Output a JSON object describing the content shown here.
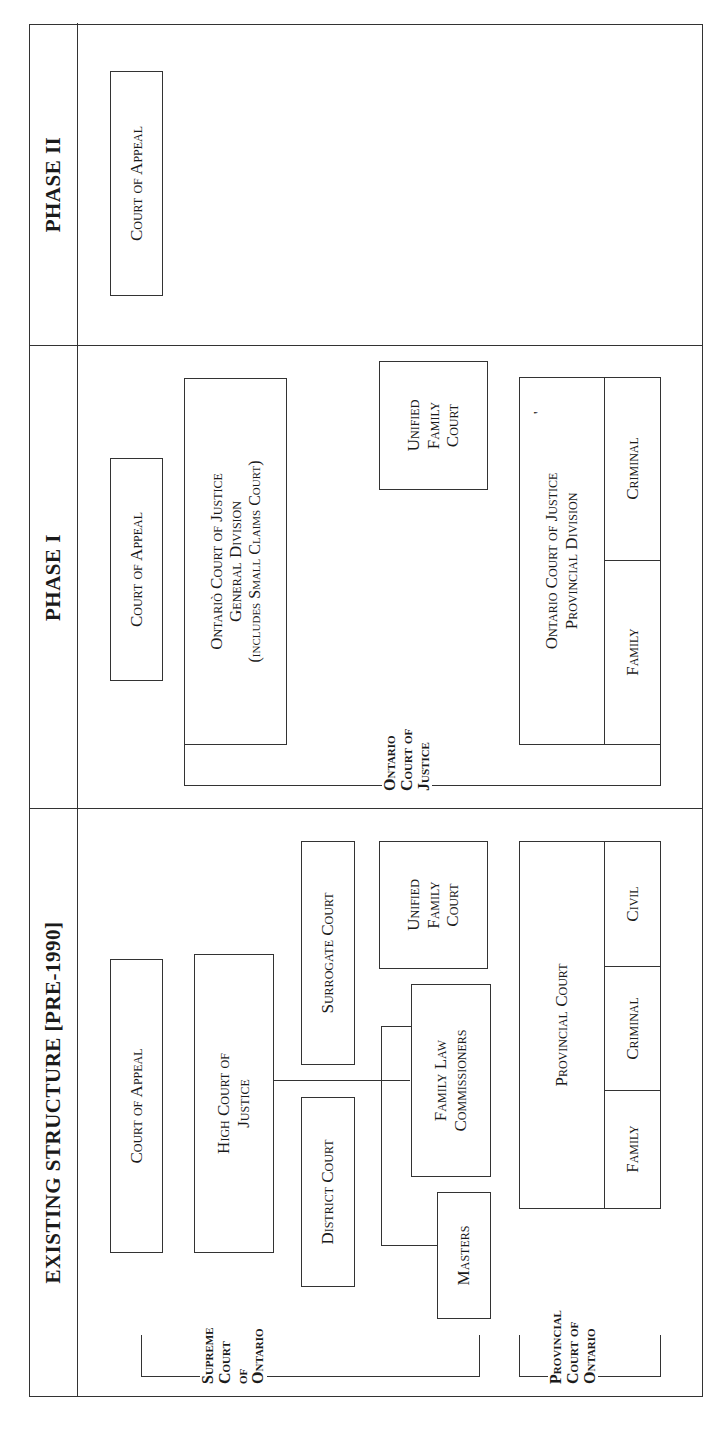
{
  "orientation": "rotated-90-ccw",
  "columns": [
    {
      "id": "existing",
      "header": "EXISTING STRUCTURE [PRE-1990]"
    },
    {
      "id": "phase1",
      "header": "PHASE I"
    },
    {
      "id": "phase2",
      "header": "PHASE II"
    }
  ],
  "existing": {
    "court_of_appeal": "Court of Appeal",
    "high_court": [
      "High Court of",
      "Justice"
    ],
    "district_court": "District Court",
    "surrogate_court": "Surrogate Court",
    "masters": "Masters",
    "family_law_commissioners": [
      "Family Law",
      "Commissioners"
    ],
    "unified_family_court": [
      "Unified",
      "Family",
      "Court"
    ],
    "provincial_court": {
      "title": "Provincial Court",
      "divisions": [
        "Family",
        "Criminal",
        "Civil"
      ]
    },
    "group_supreme": [
      "Supreme",
      "Court of",
      "Ontario"
    ],
    "group_provincial": [
      "Provincial",
      "Court of",
      "Ontario"
    ]
  },
  "phase1": {
    "court_of_appeal": "Court of Appeal",
    "general_division": [
      "Ontariò Court of Justice",
      "General Division",
      "(includes Small Claims Court)"
    ],
    "unified_family_court": [
      "Unified",
      "Family",
      "Court"
    ],
    "provincial_division": {
      "title": [
        "Ontario Court of Justice",
        "Provincial Division"
      ],
      "mark": "'",
      "divisions": [
        "Family",
        "Criminal"
      ]
    },
    "group_ocj": [
      "Ontario",
      "Court of",
      "Justice"
    ]
  },
  "phase2": {
    "court_of_appeal": "Court of Appeal",
    "ontario_court_of_justice": [
      "Ontario Court of",
      "Justice"
    ]
  }
}
